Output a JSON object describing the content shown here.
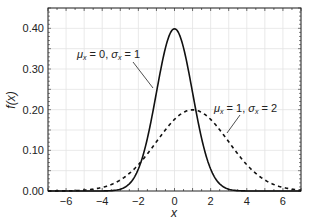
{
  "chart_data": {
    "type": "line",
    "title": "",
    "xlabel": "x",
    "ylabel": "f(x)",
    "xlim": [
      -7,
      7
    ],
    "ylim": [
      0,
      0.45
    ],
    "grid": true,
    "x_ticks": [
      -6,
      -4,
      -2,
      0,
      2,
      4,
      6
    ],
    "x_tick_labels": [
      "−6",
      "−4",
      "−2",
      "0",
      "2",
      "4",
      "6"
    ],
    "y_ticks": [
      0.0,
      0.1,
      0.2,
      0.3,
      0.4
    ],
    "y_tick_labels": [
      "0.00",
      "0.10",
      "0.20",
      "0.30",
      "0.40"
    ],
    "series": [
      {
        "name": "μx = 0, σx = 1",
        "distribution": "normal",
        "mean": 0,
        "std": 1,
        "style": "solid",
        "color": "#111111",
        "x": [
          -7,
          -6,
          -5,
          -4,
          -3,
          -2.5,
          -2,
          -1.5,
          -1,
          -0.5,
          0,
          0.5,
          1,
          1.5,
          2,
          2.5,
          3,
          4,
          5,
          6,
          7
        ],
        "values": [
          0.0,
          0.0,
          0.0,
          0.0001,
          0.0044,
          0.0175,
          0.054,
          0.1295,
          0.242,
          0.3521,
          0.3989,
          0.3521,
          0.242,
          0.1295,
          0.054,
          0.0175,
          0.0044,
          0.0001,
          0.0,
          0.0,
          0.0
        ]
      },
      {
        "name": "μx = 1, σx = 2",
        "distribution": "normal",
        "mean": 1,
        "std": 2,
        "style": "dashed",
        "color": "#111111",
        "x": [
          -7,
          -6,
          -5,
          -4,
          -3,
          -2,
          -1,
          0,
          1,
          2,
          3,
          4,
          5,
          6,
          7
        ],
        "values": [
          0.0007,
          0.0044,
          0.0022,
          0.0088,
          0.027,
          0.0648,
          0.121,
          0.176,
          0.1995,
          0.176,
          0.121,
          0.0648,
          0.027,
          0.0088,
          0.0022
        ]
      }
    ],
    "annotations": [
      {
        "text_mu": "μ",
        "sub1": "x",
        "eq1": " = 0, ",
        "text_sigma": "σ",
        "sub2": "x",
        "eq2": " = 1"
      },
      {
        "text_mu": "μ",
        "sub1": "x",
        "eq1": " = 1, ",
        "text_sigma": "σ",
        "sub2": "x",
        "eq2": " = 2"
      }
    ]
  }
}
